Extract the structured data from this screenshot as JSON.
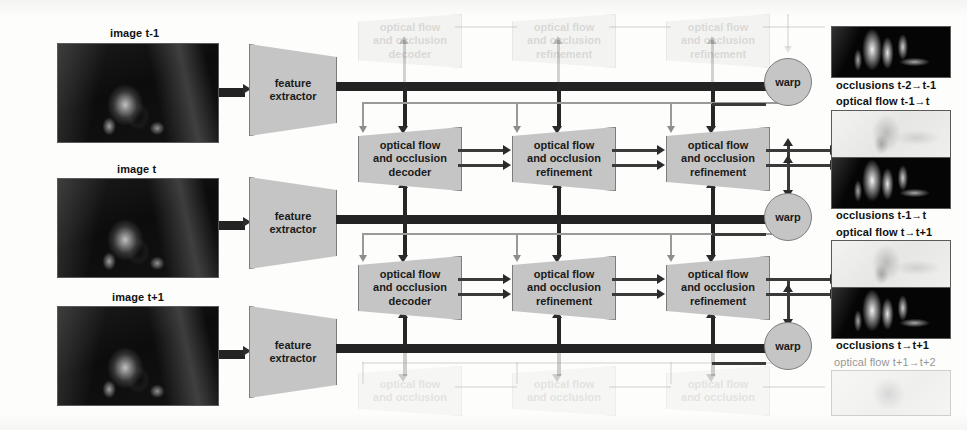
{
  "inputs": [
    {
      "label": "image t-1",
      "name": "image-t-minus-1"
    },
    {
      "label": "image t",
      "name": "image-t"
    },
    {
      "label": "image t+1",
      "name": "image-t-plus-1"
    }
  ],
  "encoders": [
    {
      "label": "feature\nextractor"
    },
    {
      "label": "feature\nextractor"
    },
    {
      "label": "feature\nextractor"
    }
  ],
  "encoder_label_line1": "feature",
  "encoder_label_line2": "extractor",
  "decoder_stage": {
    "line1": "optical flow",
    "line2": "and occlusion",
    "line3_decoder": "decoder",
    "line3_refinement": "refinement"
  },
  "rows": [
    {
      "name": "ghost-row-top",
      "faded": true,
      "blocks": [
        {
          "line1": "optical flow",
          "line2": "and occlusion",
          "line3": "decoder"
        },
        {
          "line1": "optical flow",
          "line2": "and occlusion",
          "line3": "refinement"
        },
        {
          "line1": "optical flow",
          "line2": "and occlusion",
          "line3": "refinement"
        }
      ]
    },
    {
      "name": "row-t-minus-1-to-t",
      "faded": false,
      "blocks": [
        {
          "line1": "optical flow",
          "line2": "and occlusion",
          "line3": "decoder"
        },
        {
          "line1": "optical flow",
          "line2": "and occlusion",
          "line3": "refinement"
        },
        {
          "line1": "optical flow",
          "line2": "and occlusion",
          "line3": "refinement"
        }
      ]
    },
    {
      "name": "row-t-to-t-plus-1",
      "faded": false,
      "blocks": [
        {
          "line1": "optical flow",
          "line2": "and occlusion",
          "line3": "decoder"
        },
        {
          "line1": "optical flow",
          "line2": "and occlusion",
          "line3": "refinement"
        },
        {
          "line1": "optical flow",
          "line2": "and occlusion",
          "line3": "refinement"
        }
      ]
    },
    {
      "name": "ghost-row-bottom",
      "faded": true,
      "blocks": [
        {
          "line1": "optical flow",
          "line2": "and occlusion",
          "line3": "decoder"
        },
        {
          "line1": "optical flow",
          "line2": "and occlusion",
          "line3": "refinement"
        },
        {
          "line1": "optical flow",
          "line2": "and occlusion",
          "line3": "refinement"
        }
      ]
    }
  ],
  "warps": [
    {
      "label": "warp"
    },
    {
      "label": "warp"
    },
    {
      "label": "warp"
    }
  ],
  "outputs": [
    {
      "kind": "occlusion",
      "label": "occlusions t-2→t-1",
      "faded": false,
      "caption_below": true
    },
    {
      "kind": "flow",
      "label": "optical flow t-1→t",
      "faded": false,
      "caption_below": false
    },
    {
      "kind": "occlusion",
      "label": "occlusions t-1→t",
      "faded": false,
      "caption_below": true
    },
    {
      "kind": "flow",
      "label": "optical flow t→t+1",
      "faded": false,
      "caption_below": false
    },
    {
      "kind": "occlusion",
      "label": "occlusions t→t+1",
      "faded": false,
      "caption_below": true
    },
    {
      "kind": "flow",
      "label": "optical flow t+1→t+2",
      "faded": true,
      "caption_below": false
    }
  ],
  "colors": {
    "block_fill": "#c5c5c5",
    "block_stroke": "#7d7d7d",
    "arrow_dark": "#262626",
    "arrow_light": "#9a9a9a",
    "background": "#fdfdfb"
  }
}
